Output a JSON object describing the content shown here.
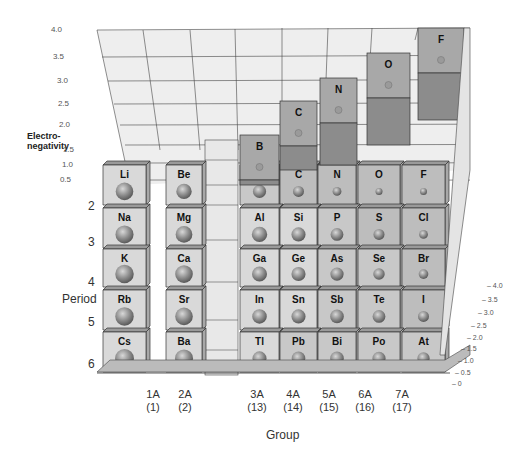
{
  "chart_data": {
    "type": "bar3d",
    "title": "",
    "ylabel": "Electro-negativity",
    "xlabel": "Group",
    "zlabel": "Period",
    "ylim": [
      0,
      4.0
    ],
    "y_ticks": [
      "0",
      "0.5",
      "1.0",
      "1.5",
      "2.0",
      "2.5",
      "3.0",
      "3.5",
      "4.0"
    ],
    "right_ticks": [
      "0",
      "0.5",
      "1.0",
      "1.5",
      "2.0",
      "2.5",
      "3.0",
      "3.5",
      "4.0"
    ],
    "groups": [
      {
        "label": "1A",
        "number": "(1)"
      },
      {
        "label": "2A",
        "number": "(2)"
      },
      {
        "label": "3A",
        "number": "(13)"
      },
      {
        "label": "4A",
        "number": "(14)"
      },
      {
        "label": "5A",
        "number": "(15)"
      },
      {
        "label": "6A",
        "number": "(16)"
      },
      {
        "label": "7A",
        "number": "(17)"
      }
    ],
    "periods": [
      "2",
      "3",
      "4",
      "5",
      "6"
    ],
    "elements": [
      {
        "symbol": "Li",
        "group": "1A",
        "period": 2,
        "value": 1.0
      },
      {
        "symbol": "Be",
        "group": "2A",
        "period": 2,
        "value": 1.5
      },
      {
        "symbol": "B",
        "group": "3A",
        "period": 2,
        "value": 2.0
      },
      {
        "symbol": "C",
        "group": "4A",
        "period": 2,
        "value": 2.5
      },
      {
        "symbol": "N",
        "group": "5A",
        "period": 2,
        "value": 3.0
      },
      {
        "symbol": "O",
        "group": "6A",
        "period": 2,
        "value": 3.5
      },
      {
        "symbol": "F",
        "group": "7A",
        "period": 2,
        "value": 4.0
      },
      {
        "symbol": "Na",
        "group": "1A",
        "period": 3,
        "value": 0.9
      },
      {
        "symbol": "Mg",
        "group": "2A",
        "period": 3,
        "value": 1.2
      },
      {
        "symbol": "Al",
        "group": "3A",
        "period": 3,
        "value": 1.5
      },
      {
        "symbol": "Si",
        "group": "4A",
        "period": 3,
        "value": 1.8
      },
      {
        "symbol": "P",
        "group": "5A",
        "period": 3,
        "value": 2.1
      },
      {
        "symbol": "S",
        "group": "6A",
        "period": 3,
        "value": 2.5
      },
      {
        "symbol": "Cl",
        "group": "7A",
        "period": 3,
        "value": 3.0
      },
      {
        "symbol": "K",
        "group": "1A",
        "period": 4,
        "value": 0.8
      },
      {
        "symbol": "Ca",
        "group": "2A",
        "period": 4,
        "value": 1.0
      },
      {
        "symbol": "Ga",
        "group": "3A",
        "period": 4,
        "value": 1.6
      },
      {
        "symbol": "Ge",
        "group": "4A",
        "period": 4,
        "value": 1.8
      },
      {
        "symbol": "As",
        "group": "5A",
        "period": 4,
        "value": 2.0
      },
      {
        "symbol": "Se",
        "group": "6A",
        "period": 4,
        "value": 2.4
      },
      {
        "symbol": "Br",
        "group": "7A",
        "period": 4,
        "value": 2.8
      },
      {
        "symbol": "Rb",
        "group": "1A",
        "period": 5,
        "value": 0.8
      },
      {
        "symbol": "Sr",
        "group": "2A",
        "period": 5,
        "value": 1.0
      },
      {
        "symbol": "In",
        "group": "3A",
        "period": 5,
        "value": 1.7
      },
      {
        "symbol": "Sn",
        "group": "4A",
        "period": 5,
        "value": 1.8
      },
      {
        "symbol": "Sb",
        "group": "5A",
        "period": 5,
        "value": 1.9
      },
      {
        "symbol": "Te",
        "group": "6A",
        "period": 5,
        "value": 2.1
      },
      {
        "symbol": "I",
        "group": "7A",
        "period": 5,
        "value": 2.5
      },
      {
        "symbol": "Cs",
        "group": "1A",
        "period": 6,
        "value": 0.7
      },
      {
        "symbol": "Ba",
        "group": "2A",
        "period": 6,
        "value": 0.9
      },
      {
        "symbol": "Tl",
        "group": "3A",
        "period": 6,
        "value": 1.8
      },
      {
        "symbol": "Pb",
        "group": "4A",
        "period": 6,
        "value": 1.9
      },
      {
        "symbol": "Bi",
        "group": "5A",
        "period": 6,
        "value": 1.9
      },
      {
        "symbol": "Po",
        "group": "6A",
        "period": 6,
        "value": 2.0
      },
      {
        "symbol": "At",
        "group": "7A",
        "period": 6,
        "value": 2.2
      }
    ],
    "grid": true,
    "legend": null
  },
  "labels": {
    "en_title_line1": "Electro-",
    "en_title_line2": "negativity",
    "period_title": "Period",
    "group_title": "Group"
  },
  "colors": {
    "block_light": "#d9d9d9",
    "block_mid": "#bdbdbd",
    "block_dark": "#9a9a9a",
    "wall": "#ececec",
    "grid": "#555555"
  }
}
